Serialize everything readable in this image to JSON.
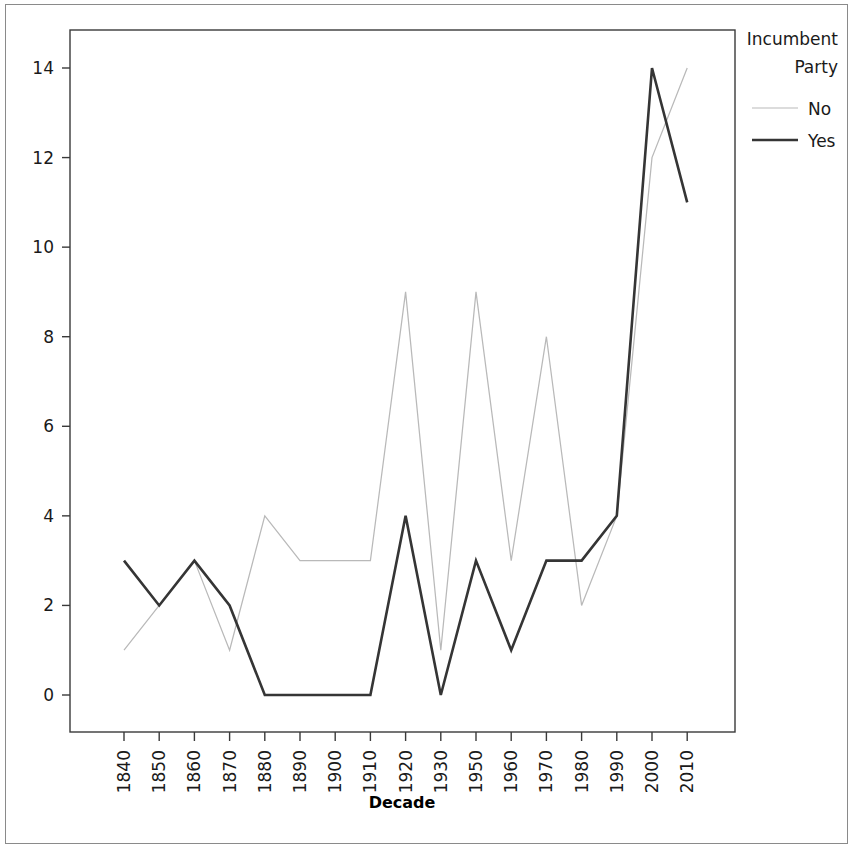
{
  "chart_data": {
    "type": "line",
    "title": "",
    "xlabel": "Decade",
    "ylabel": "",
    "categories": [
      "1840",
      "1850",
      "1860",
      "1870",
      "1880",
      "1890",
      "1900",
      "1910",
      "1920",
      "1930",
      "1950",
      "1960",
      "1970",
      "1980",
      "1990",
      "2000",
      "2010"
    ],
    "series": [
      {
        "name": "No",
        "color": "#b9b9b9",
        "values": [
          1,
          2,
          3,
          1,
          4,
          3,
          3,
          3,
          9,
          1,
          9,
          3,
          8,
          2,
          4,
          12,
          14
        ]
      },
      {
        "name": "Yes",
        "color": "#353535",
        "values": [
          3,
          2,
          3,
          2,
          0,
          0,
          0,
          0,
          4,
          0,
          3,
          1,
          3,
          3,
          4,
          14,
          11
        ]
      }
    ],
    "ylim": [
      -0.35,
      14.8
    ],
    "yticks": [
      "0",
      "2",
      "4",
      "6",
      "8",
      "10",
      "12",
      "14"
    ],
    "ytick_values": [
      0,
      2,
      4,
      6,
      8,
      10,
      12,
      14
    ],
    "grid": false,
    "legend_position": "right"
  },
  "legend": {
    "title_line1": "Incumbent",
    "title_line2": "Party",
    "entries": [
      {
        "label": "No",
        "color": "#b9b9b9",
        "width": 1.2
      },
      {
        "label": "Yes",
        "color": "#353535",
        "width": 2.6
      }
    ]
  },
  "axes": {
    "x_title": "Decade"
  }
}
